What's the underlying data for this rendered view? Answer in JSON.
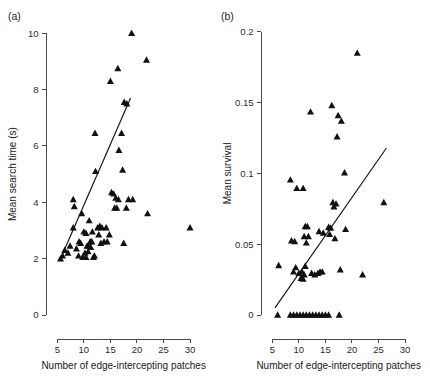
{
  "figure": {
    "panels": [
      {
        "tag": "(a)",
        "xlabel": "Number of edge-intercepting patches",
        "ylabel": "Mean search time (s)",
        "xticks": [
          "5",
          "10",
          "15",
          "20",
          "25",
          "30"
        ],
        "yticks": [
          "0",
          "2",
          "4",
          "6",
          "8",
          "10"
        ]
      },
      {
        "tag": "(b)",
        "xlabel": "Number of edge-intercepting patches",
        "ylabel": "Mean survival",
        "xticks": [
          "5",
          "10",
          "15",
          "20",
          "25",
          "30"
        ],
        "yticks": [
          "0",
          "0.05",
          "0.1",
          "0.15",
          "0.2"
        ]
      }
    ]
  },
  "chart_data": [
    {
      "type": "scatter",
      "panel": "(a)",
      "title": "",
      "xlabel": "Number of edge-intercepting patches",
      "ylabel": "Mean search time (s)",
      "xlim": [
        4.0,
        31.5
      ],
      "ylim": [
        0,
        10.4
      ],
      "xticks": [
        5,
        10,
        15,
        20,
        25,
        30
      ],
      "yticks": [
        0,
        2,
        4,
        6,
        8,
        10
      ],
      "grid": false,
      "legend": null,
      "marker": "filled-triangle-up",
      "marker_color": "#111111",
      "points": [
        [
          19.0,
          10.0
        ],
        [
          21.8,
          9.05
        ],
        [
          16.4,
          8.75
        ],
        [
          15.0,
          8.3
        ],
        [
          17.6,
          7.55
        ],
        [
          18.1,
          7.5
        ],
        [
          12.1,
          6.45
        ],
        [
          17.1,
          6.45
        ],
        [
          16.6,
          5.85
        ],
        [
          12.2,
          5.1
        ],
        [
          17.3,
          5.15
        ],
        [
          8.0,
          4.1
        ],
        [
          15.2,
          4.35
        ],
        [
          15.6,
          4.3
        ],
        [
          8.2,
          3.85
        ],
        [
          9.6,
          3.6
        ],
        [
          16.0,
          4.15
        ],
        [
          16.5,
          4.1
        ],
        [
          18.4,
          4.1
        ],
        [
          19.2,
          4.1
        ],
        [
          16.2,
          3.8
        ],
        [
          18.0,
          3.8
        ],
        [
          22.0,
          3.6
        ],
        [
          11.0,
          3.35
        ],
        [
          12.6,
          3.1
        ],
        [
          13.0,
          3.15
        ],
        [
          13.4,
          3.1
        ],
        [
          8.0,
          3.1
        ],
        [
          14.2,
          3.1
        ],
        [
          30.0,
          3.1
        ],
        [
          10.0,
          2.95
        ],
        [
          10.4,
          2.9
        ],
        [
          12.8,
          2.85
        ],
        [
          14.8,
          2.85
        ],
        [
          9.1,
          2.6
        ],
        [
          9.4,
          2.55
        ],
        [
          11.2,
          2.6
        ],
        [
          11.5,
          2.6
        ],
        [
          13.8,
          2.6
        ],
        [
          14.4,
          2.6
        ],
        [
          17.5,
          2.55
        ],
        [
          7.4,
          2.45
        ],
        [
          8.6,
          2.35
        ],
        [
          10.6,
          2.45
        ],
        [
          11.0,
          2.45
        ],
        [
          11.3,
          2.4
        ],
        [
          6.4,
          2.3
        ],
        [
          7.0,
          2.2
        ],
        [
          10.2,
          2.2
        ],
        [
          10.8,
          2.25
        ],
        [
          6.0,
          2.1
        ],
        [
          9.8,
          2.05
        ],
        [
          10.4,
          2.05
        ],
        [
          11.8,
          2.05
        ],
        [
          12.0,
          2.1
        ],
        [
          5.6,
          2.0
        ],
        [
          9.0,
          2.1
        ],
        [
          13.2,
          2.55
        ],
        [
          15.8,
          3.8
        ],
        [
          11.6,
          2.95
        ]
      ],
      "fit_line": {
        "x": [
          5.5,
          18.8
        ],
        "y": [
          1.95,
          7.7
        ]
      }
    },
    {
      "type": "scatter",
      "panel": "(b)",
      "title": "",
      "xlabel": "Number of edge-intercepting patches",
      "ylabel": "Mean survival",
      "xlim": [
        4.0,
        31.5
      ],
      "ylim": [
        0,
        0.207
      ],
      "xticks": [
        5,
        10,
        15,
        20,
        25,
        30
      ],
      "yticks": [
        0,
        0.05,
        0.1,
        0.15,
        0.2
      ],
      "grid": false,
      "legend": null,
      "marker": "filled-triangle-up",
      "marker_color": "#111111",
      "points": [
        [
          21.0,
          0.185
        ],
        [
          16.2,
          0.148
        ],
        [
          12.2,
          0.1435
        ],
        [
          17.4,
          0.141
        ],
        [
          18.0,
          0.137
        ],
        [
          17.2,
          0.126
        ],
        [
          8.4,
          0.0955
        ],
        [
          18.6,
          0.1005
        ],
        [
          9.6,
          0.0895
        ],
        [
          10.8,
          0.0895
        ],
        [
          16.4,
          0.0795
        ],
        [
          17.0,
          0.0785
        ],
        [
          16.6,
          0.0765
        ],
        [
          26.0,
          0.0795
        ],
        [
          11.2,
          0.0625
        ],
        [
          11.6,
          0.0625
        ],
        [
          15.6,
          0.062
        ],
        [
          16.0,
          0.0615
        ],
        [
          13.8,
          0.059
        ],
        [
          11.0,
          0.0555
        ],
        [
          11.8,
          0.0555
        ],
        [
          15.8,
          0.057
        ],
        [
          14.6,
          0.058
        ],
        [
          18.8,
          0.0605
        ],
        [
          11.4,
          0.051
        ],
        [
          16.8,
          0.054
        ],
        [
          8.6,
          0.0525
        ],
        [
          9.2,
          0.052
        ],
        [
          6.2,
          0.035
        ],
        [
          9.4,
          0.0335
        ],
        [
          11.2,
          0.0345
        ],
        [
          17.8,
          0.032
        ],
        [
          9.0,
          0.0305
        ],
        [
          10.0,
          0.0295
        ],
        [
          10.6,
          0.0305
        ],
        [
          11.0,
          0.0285
        ],
        [
          12.4,
          0.0295
        ],
        [
          13.0,
          0.0285
        ],
        [
          13.6,
          0.0295
        ],
        [
          14.0,
          0.0305
        ],
        [
          14.4,
          0.0305
        ],
        [
          22.0,
          0.0285
        ],
        [
          10.4,
          0.026
        ],
        [
          10.8,
          0.0255
        ],
        [
          6.0,
          0.0
        ],
        [
          8.4,
          0.0
        ],
        [
          9.0,
          0.0
        ],
        [
          9.6,
          0.0
        ],
        [
          10.2,
          0.0
        ],
        [
          10.8,
          0.0
        ],
        [
          11.4,
          0.0
        ],
        [
          12.0,
          0.0
        ],
        [
          12.6,
          0.0
        ],
        [
          13.2,
          0.0
        ],
        [
          13.8,
          0.0
        ],
        [
          14.4,
          0.0
        ],
        [
          15.0,
          0.0
        ],
        [
          15.6,
          0.0
        ],
        [
          17.6,
          0.0
        ]
      ],
      "fit_line": {
        "x": [
          5.5,
          26.5
        ],
        "y": [
          0.005,
          0.118
        ]
      }
    }
  ]
}
